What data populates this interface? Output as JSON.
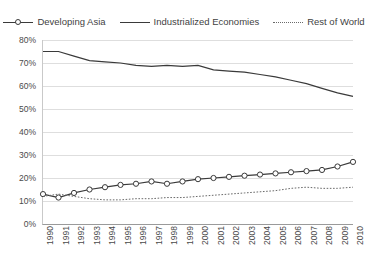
{
  "chart_data": {
    "type": "line",
    "title": "",
    "subtitle": "",
    "xlabel": "",
    "ylabel": "",
    "x": [
      1990,
      1991,
      1992,
      1993,
      1994,
      1995,
      1996,
      1997,
      1998,
      1999,
      2000,
      2001,
      2002,
      2003,
      2004,
      2005,
      2006,
      2007,
      2008,
      2009,
      2010
    ],
    "xtick_labels": [
      "1990",
      "1991",
      "1992",
      "1993",
      "1994",
      "1995",
      "1996",
      "1997",
      "1998",
      "1999",
      "2000",
      "2001",
      "2002",
      "2003",
      "2004",
      "2005",
      "2006",
      "2007",
      "2008",
      "2009",
      "2010"
    ],
    "ytick_labels": [
      "80%",
      "70%",
      "60%",
      "50%",
      "40%",
      "30%",
      "20%",
      "10%",
      "0%"
    ],
    "ytick_values": [
      80,
      70,
      60,
      50,
      40,
      30,
      20,
      10,
      0
    ],
    "ylim": [
      0,
      80
    ],
    "xlim": [
      1990,
      2010
    ],
    "grid": true,
    "legend_position": "top",
    "series": [
      {
        "name": "Developing Asia",
        "style": "line-with-markers",
        "marker": "circle",
        "color": "#3a3a3a",
        "values": [
          13.0,
          11.5,
          13.5,
          15.0,
          16.0,
          17.0,
          17.5,
          18.5,
          17.5,
          18.5,
          19.5,
          20.0,
          20.5,
          21.0,
          21.5,
          22.0,
          22.5,
          23.0,
          23.5,
          25.0,
          27.0
        ]
      },
      {
        "name": "Industrialized Economies",
        "style": "solid",
        "marker": "none",
        "color": "#3a3a3a",
        "values": [
          75.0,
          75.0,
          73.0,
          71.0,
          70.5,
          70.0,
          69.0,
          68.5,
          69.0,
          68.5,
          69.0,
          67.0,
          66.5,
          66.0,
          65.0,
          64.0,
          62.5,
          61.0,
          59.0,
          57.0,
          55.5
        ]
      },
      {
        "name": "Rest of World",
        "style": "dotted",
        "marker": "none",
        "color": "#6a6a6a",
        "values": [
          12.0,
          13.0,
          12.0,
          11.0,
          10.5,
          10.5,
          11.0,
          11.0,
          11.5,
          11.5,
          12.0,
          12.5,
          13.0,
          13.5,
          14.0,
          14.5,
          15.5,
          16.0,
          15.5,
          15.5,
          16.0
        ]
      }
    ]
  }
}
